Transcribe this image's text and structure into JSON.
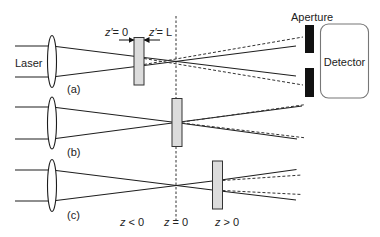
{
  "figure": {
    "type": "z-scan optical setup schematic",
    "panels": [
      {
        "id": "a",
        "label": "(a)",
        "sample_position": "z < 0"
      },
      {
        "id": "b",
        "label": "(b)",
        "sample_position": "z = 0"
      },
      {
        "id": "c",
        "label": "(c)",
        "sample_position": "z > 0"
      }
    ]
  },
  "labels": {
    "laser": "Laser",
    "aperture": "Aperture",
    "detector": "Detector",
    "panel_a": "(a)",
    "panel_b": "(b)",
    "panel_c": "(c)",
    "z_prime_0": {
      "var": "z′",
      "rest": "= 0"
    },
    "z_prime_L": {
      "var": "z′",
      "rest": "= L"
    },
    "z_neg": {
      "var": "z",
      "rest": " < 0"
    },
    "z_zero": {
      "var": "z",
      "rest": " = 0"
    },
    "z_pos": {
      "var": "z",
      "rest": " > 0"
    }
  },
  "colors": {
    "beam": "#1e1e1e",
    "sample_fill": "#dcdcdc",
    "aperture": "#111111",
    "detector_border": "#777777",
    "background": "#ffffff"
  }
}
